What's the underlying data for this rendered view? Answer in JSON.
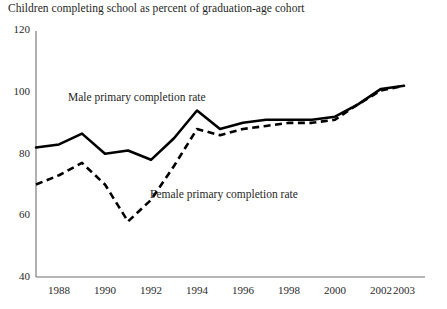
{
  "chart_data": {
    "type": "line",
    "title": "Children completing school as percent of graduation-age cohort",
    "xlabel": "",
    "ylabel": "",
    "ylim": [
      40,
      120
    ],
    "xlim": [
      1987,
      2003
    ],
    "grid": false,
    "legend_position": "inline-annotations",
    "ytick_labels": [
      "120",
      "100",
      "80",
      "60",
      "40"
    ],
    "ytick_values": [
      120,
      100,
      80,
      60,
      40
    ],
    "xtick_labels": [
      "1988",
      "1990",
      "1992",
      "1994",
      "1996",
      "1998",
      "2000",
      "2002",
      "2003"
    ],
    "xtick_values": [
      1988,
      1990,
      1992,
      1994,
      1996,
      1998,
      2000,
      2002,
      2003
    ],
    "x": [
      1987,
      1988,
      1989,
      1990,
      1991,
      1992,
      1993,
      1994,
      1995,
      1996,
      1997,
      1998,
      1999,
      2000,
      2001,
      2002,
      2003
    ],
    "series": [
      {
        "name": "Male primary completion rate",
        "style": "solid",
        "color": "#000000",
        "values": [
          82,
          83,
          86.5,
          80,
          81,
          78,
          85,
          94,
          88,
          90,
          91,
          91,
          91,
          92,
          96,
          101,
          102
        ]
      },
      {
        "name": "Female primary completion rate",
        "style": "dashed",
        "color": "#000000",
        "values": [
          70,
          73,
          77,
          70,
          58,
          65,
          76,
          88,
          86,
          88,
          89,
          90,
          90,
          91,
          96,
          100.5,
          102
        ]
      }
    ],
    "annotations": [
      {
        "text": "Male primary completion rate",
        "x_px": 68,
        "y_px": 91
      },
      {
        "text": "Female primary completion rate",
        "x_px": 150,
        "y_px": 188
      }
    ]
  },
  "axis": {
    "line_color": "#6e6e6e"
  }
}
